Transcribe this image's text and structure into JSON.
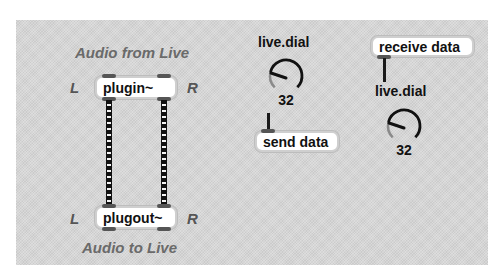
{
  "patch": {
    "background_color": "#d6d6d6",
    "plugin_section": {
      "title_top": "Audio from Live",
      "title_bottom": "Audio to Live",
      "left_channel_label": "L",
      "right_channel_label": "R",
      "plugin_object": "plugin~",
      "plugout_object": "plugout~"
    },
    "send_section": {
      "dial_label": "live.dial",
      "dial_value": "32",
      "send_object": "send data"
    },
    "receive_section": {
      "receive_object": "receive data",
      "dial_label": "live.dial",
      "dial_value": "32"
    }
  }
}
